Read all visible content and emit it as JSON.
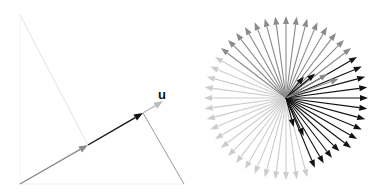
{
  "left_panel": {
    "label": "u",
    "label_pos": [
      158,
      99
    ],
    "frame_lines": [
      {
        "name": "left-edge",
        "from": [
          20,
          15
        ],
        "to": [
          20,
          184
        ],
        "color": "#f2f2f2"
      },
      {
        "name": "bottom-edge",
        "from": [
          20,
          184
        ],
        "to": [
          184,
          184
        ],
        "color": "#eeeeee"
      },
      {
        "name": "diagonal-faint",
        "from": [
          20,
          15
        ],
        "to": [
          88,
          145
        ],
        "color": "#e2e2e2"
      },
      {
        "name": "projection-line",
        "from": [
          143,
          113
        ],
        "to": [
          184,
          184
        ],
        "color": "#9a9a9a"
      }
    ],
    "arrows": [
      {
        "name": "gray-vector",
        "from": [
          20,
          184
        ],
        "to": [
          88,
          145
        ],
        "color": "#8a8a8a"
      },
      {
        "name": "black-vector",
        "from": [
          88,
          145
        ],
        "to": [
          143,
          113
        ],
        "color": "#111111"
      },
      {
        "name": "u-vector",
        "from": [
          143,
          113
        ],
        "to": [
          163,
          101
        ],
        "color": "#bbbbbb"
      }
    ]
  },
  "right_panel": {
    "center": [
      286,
      98
    ],
    "radius": 82,
    "count": 48,
    "dark_color": "#111111",
    "mid_color": "#8a8a8a",
    "light_color": "#cccccc"
  }
}
